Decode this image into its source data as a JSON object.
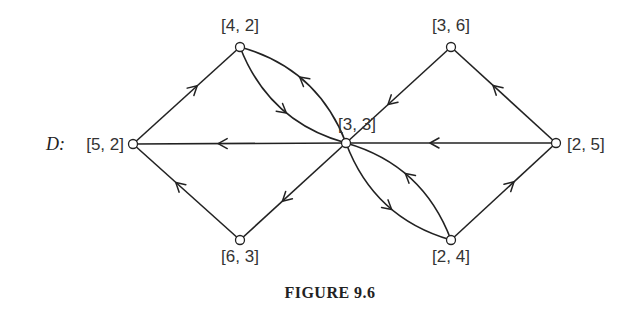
{
  "figure": {
    "graph_name": "D:",
    "caption": "FIGURE 9.6"
  },
  "nodes": [
    {
      "id": "n42",
      "label": "[4, 2]"
    },
    {
      "id": "n36",
      "label": "[3, 6]"
    },
    {
      "id": "n33",
      "label": "[3, 3]"
    },
    {
      "id": "n52",
      "label": "[5, 2]"
    },
    {
      "id": "n25",
      "label": "[2, 5]"
    },
    {
      "id": "n63",
      "label": "[6, 3]"
    },
    {
      "id": "n24",
      "label": "[2, 4]"
    }
  ],
  "edges": [
    {
      "from": "n52",
      "to": "n42"
    },
    {
      "from": "n42",
      "to": "n33"
    },
    {
      "from": "n33",
      "to": "n42"
    },
    {
      "from": "n36",
      "to": "n33"
    },
    {
      "from": "n25",
      "to": "n36"
    },
    {
      "from": "n33",
      "to": "n52"
    },
    {
      "from": "n25",
      "to": "n33"
    },
    {
      "from": "n63",
      "to": "n52"
    },
    {
      "from": "n33",
      "to": "n63"
    },
    {
      "from": "n33",
      "to": "n24"
    },
    {
      "from": "n24",
      "to": "n33"
    },
    {
      "from": "n24",
      "to": "n25"
    }
  ]
}
